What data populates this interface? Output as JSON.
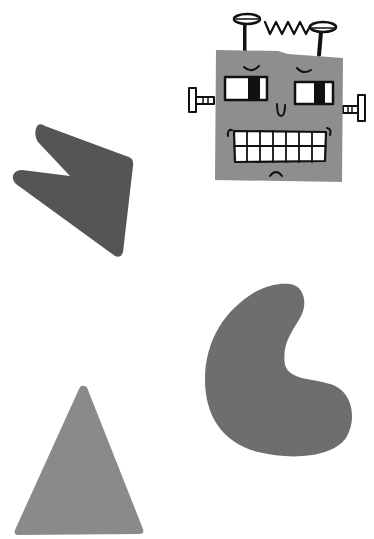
{
  "scene": {
    "title": "Shapes and robot illustration",
    "background": "#ffffff",
    "shapes": [
      {
        "name": "robot-head",
        "kind": "square",
        "color": "#8e8e8e"
      },
      {
        "name": "arrow-shape",
        "kind": "irregular-arrowhead",
        "color": "#555555"
      },
      {
        "name": "bean-shape",
        "kind": "bean",
        "color": "#6e6e6e"
      },
      {
        "name": "triangle-shape",
        "kind": "triangle",
        "color": "#8a8a8a"
      }
    ],
    "robot": {
      "line_color": "#111111",
      "face_color": "#8e8e8e",
      "eye_color": "#ffffff"
    }
  }
}
